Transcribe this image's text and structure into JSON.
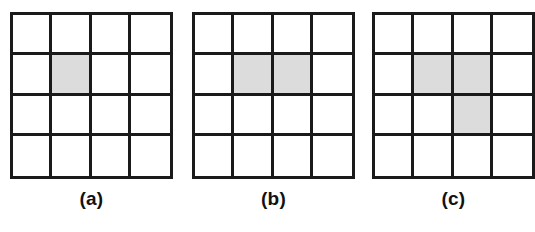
{
  "figure": {
    "background_color": "#ffffff",
    "line_color": "#1a1a1a",
    "cell_fill_color": "#ffffff",
    "shaded_fill_color": "#dcdcdc",
    "grid_rows": 4,
    "grid_cols": 4,
    "panels": [
      {
        "id": "a",
        "label": "(a)",
        "shaded_count": 1,
        "shaded_cells": [
          {
            "row": 2,
            "col": 2
          }
        ],
        "cells": [
          [
            0,
            0,
            0,
            0
          ],
          [
            0,
            1,
            0,
            0
          ],
          [
            0,
            0,
            0,
            0
          ],
          [
            0,
            0,
            0,
            0
          ]
        ]
      },
      {
        "id": "b",
        "label": "(b)",
        "shaded_count": 2,
        "shaded_cells": [
          {
            "row": 2,
            "col": 2
          },
          {
            "row": 2,
            "col": 3
          }
        ],
        "cells": [
          [
            0,
            0,
            0,
            0
          ],
          [
            0,
            1,
            1,
            0
          ],
          [
            0,
            0,
            0,
            0
          ],
          [
            0,
            0,
            0,
            0
          ]
        ]
      },
      {
        "id": "c",
        "label": "(c)",
        "shaded_count": 3,
        "shaded_cells": [
          {
            "row": 2,
            "col": 2
          },
          {
            "row": 2,
            "col": 3
          },
          {
            "row": 3,
            "col": 3
          }
        ],
        "cells": [
          [
            0,
            0,
            0,
            0
          ],
          [
            0,
            1,
            1,
            0
          ],
          [
            0,
            0,
            1,
            0
          ],
          [
            0,
            0,
            0,
            0
          ]
        ]
      }
    ]
  }
}
